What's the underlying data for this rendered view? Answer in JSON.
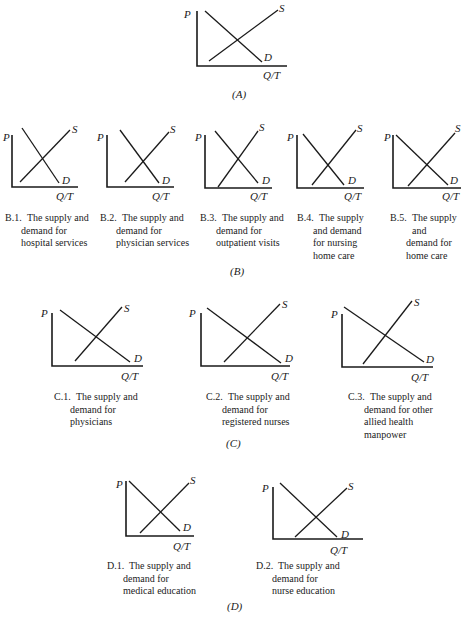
{
  "figure": {
    "axis_labels": {
      "price": "P",
      "quantity": "Q/T",
      "supply": "S",
      "demand": "D"
    },
    "sections": [
      {
        "id": "A",
        "label": "(A)",
        "x": 232,
        "y": 88
      },
      {
        "id": "B",
        "label": "(B)",
        "x": 230,
        "y": 265
      },
      {
        "id": "C",
        "label": "(C)",
        "x": 226,
        "y": 437
      },
      {
        "id": "D",
        "label": "(D)",
        "x": 227,
        "y": 600
      }
    ],
    "panels": [
      {
        "id": "A",
        "caption_num": "",
        "caption": [],
        "axis": {
          "x": 197,
          "top": 11,
          "bottom": 66,
          "right": 287
        },
        "demand": [
          205,
          11,
          262,
          62
        ],
        "supply": [
          209,
          61,
          278,
          10
        ],
        "p_pos": [
          184,
          8
        ],
        "s_pos": [
          279,
          2
        ],
        "d_pos": [
          264,
          51
        ],
        "qt_pos": [
          263,
          69
        ]
      },
      {
        "id": "B.1",
        "caption_num": "B.1.",
        "caption": [
          "The supply and",
          "demand for",
          "hospital services"
        ],
        "cap_pos": [
          5,
          212
        ],
        "axis": {
          "x": 12,
          "top": 135,
          "bottom": 187,
          "right": 78
        },
        "demand": [
          22,
          128,
          59,
          183
        ],
        "supply": [
          20,
          182,
          70,
          130
        ],
        "p_pos": [
          3,
          131
        ],
        "s_pos": [
          72,
          123
        ],
        "d_pos": [
          62,
          174
        ],
        "qt_pos": [
          56,
          190
        ]
      },
      {
        "id": "B.2",
        "caption_num": "B.2.",
        "caption": [
          "The supply and",
          "demand for",
          "physician services"
        ],
        "cap_pos": [
          100,
          212
        ],
        "axis": {
          "x": 107,
          "top": 135,
          "bottom": 187,
          "right": 174
        },
        "demand": [
          120,
          130,
          159,
          183
        ],
        "supply": [
          125,
          182,
          169,
          132
        ],
        "p_pos": [
          97,
          131
        ],
        "s_pos": [
          170,
          123
        ],
        "d_pos": [
          162,
          174
        ],
        "qt_pos": [
          152,
          190
        ]
      },
      {
        "id": "B.3",
        "caption_num": "B.3.",
        "caption": [
          "The supply and",
          "demand for",
          "outpatient visits"
        ],
        "cap_pos": [
          200,
          212
        ],
        "axis": {
          "x": 205,
          "top": 135,
          "bottom": 188,
          "right": 272
        },
        "demand": [
          215,
          131,
          258,
          183
        ],
        "supply": [
          218,
          187,
          258,
          131
        ],
        "p_pos": [
          195,
          131
        ],
        "s_pos": [
          259,
          121
        ],
        "d_pos": [
          262,
          174
        ],
        "qt_pos": [
          250,
          190
        ]
      },
      {
        "id": "B.4",
        "caption_num": "B.4.",
        "caption": [
          "The supply",
          "and demand",
          "for nursing",
          "home care"
        ],
        "cap_pos": [
          297,
          212
        ],
        "axis": {
          "x": 297,
          "top": 135,
          "bottom": 188,
          "right": 364
        },
        "demand": [
          303,
          134,
          344,
          185
        ],
        "supply": [
          312,
          185,
          356,
          130
        ],
        "p_pos": [
          287,
          131
        ],
        "s_pos": [
          357,
          122
        ],
        "d_pos": [
          348,
          174
        ],
        "qt_pos": [
          344,
          190
        ]
      },
      {
        "id": "B.5",
        "caption_num": "B.5.",
        "caption": [
          "The supply and",
          "demand for",
          "home care"
        ],
        "cap_pos": [
          390,
          212
        ],
        "axis": {
          "x": 393,
          "top": 135,
          "bottom": 188,
          "right": 461
        },
        "demand": [
          396,
          135,
          448,
          185
        ],
        "supply": [
          408,
          186,
          455,
          133
        ],
        "p_pos": [
          384,
          131
        ],
        "s_pos": [
          455,
          122
        ],
        "d_pos": [
          450,
          174
        ],
        "qt_pos": [
          442,
          190
        ]
      },
      {
        "id": "C.1",
        "caption_num": "C.1.",
        "caption": [
          "The supply and",
          "demand for",
          "physicians"
        ],
        "cap_pos": [
          54,
          391
        ],
        "axis": {
          "x": 52,
          "top": 313,
          "bottom": 366,
          "right": 143
        },
        "demand": [
          60,
          310,
          130,
          362
        ],
        "supply": [
          75,
          361,
          122,
          307
        ],
        "p_pos": [
          41,
          307
        ],
        "s_pos": [
          124,
          302
        ],
        "d_pos": [
          134,
          352
        ],
        "qt_pos": [
          121,
          370
        ]
      },
      {
        "id": "C.2",
        "caption_num": "C.2.",
        "caption": [
          "The supply and",
          "demand for",
          "registered nurses"
        ],
        "cap_pos": [
          206,
          391
        ],
        "axis": {
          "x": 201,
          "top": 313,
          "bottom": 366,
          "right": 290
        },
        "demand": [
          207,
          308,
          281,
          363
        ],
        "supply": [
          224,
          362,
          280,
          304
        ],
        "p_pos": [
          189,
          307
        ],
        "s_pos": [
          282,
          298
        ],
        "d_pos": [
          285,
          352
        ],
        "qt_pos": [
          271,
          370
        ]
      },
      {
        "id": "C.3",
        "caption_num": "C.3.",
        "caption": [
          "The supply and",
          "demand for other",
          "allied health",
          "manpower"
        ],
        "cap_pos": [
          348,
          391
        ],
        "axis": {
          "x": 342,
          "top": 314,
          "bottom": 367,
          "right": 433
        },
        "demand": [
          344,
          307,
          424,
          362
        ],
        "supply": [
          363,
          364,
          412,
          301
        ],
        "p_pos": [
          331,
          308
        ],
        "s_pos": [
          414,
          296
        ],
        "d_pos": [
          426,
          353
        ],
        "qt_pos": [
          411,
          371
        ]
      },
      {
        "id": "D.1",
        "caption_num": "D.1.",
        "caption": [
          "The supply and",
          "demand for",
          "medical education"
        ],
        "cap_pos": [
          107,
          560
        ],
        "axis": {
          "x": 126,
          "top": 481,
          "bottom": 536,
          "right": 194
        },
        "demand": [
          129,
          481,
          180,
          531
        ],
        "supply": [
          140,
          533,
          189,
          483
        ],
        "p_pos": [
          116,
          478
        ],
        "s_pos": [
          190,
          474
        ],
        "d_pos": [
          183,
          521
        ],
        "qt_pos": [
          173,
          540
        ]
      },
      {
        "id": "D.2",
        "caption_num": "D.2.",
        "caption": [
          "The supply and",
          "demand for",
          "nurse education"
        ],
        "cap_pos": [
          256,
          560
        ],
        "axis": {
          "x": 273,
          "top": 487,
          "bottom": 539,
          "right": 363
        },
        "demand": [
          280,
          483,
          337,
          537
        ],
        "supply": [
          295,
          537,
          347,
          488
        ],
        "p_pos": [
          262,
          482
        ],
        "s_pos": [
          348,
          480
        ],
        "d_pos": [
          341,
          528
        ],
        "qt_pos": [
          330,
          544
        ]
      }
    ]
  },
  "chart_data": {
    "type": "line",
    "xlabel": "Q/T",
    "ylabel": "P",
    "grid": false,
    "series_labels": [
      "S",
      "D"
    ],
    "panels": [
      {
        "id": "A",
        "caption": "",
        "demand_slope": "moderate downward",
        "supply_slope": "moderate upward"
      },
      {
        "id": "B.1",
        "caption": "The supply and demand for hospital services"
      },
      {
        "id": "B.2",
        "caption": "The supply and demand for physician services"
      },
      {
        "id": "B.3",
        "caption": "The supply and demand for outpatient visits"
      },
      {
        "id": "B.4",
        "caption": "The supply and demand for nursing home care"
      },
      {
        "id": "B.5",
        "caption": "The supply and demand for home care"
      },
      {
        "id": "C.1",
        "caption": "The supply and demand for physicians"
      },
      {
        "id": "C.2",
        "caption": "The supply and demand for registered nurses"
      },
      {
        "id": "C.3",
        "caption": "The supply and demand for other allied health manpower"
      },
      {
        "id": "D.1",
        "caption": "The supply and demand for medical education"
      },
      {
        "id": "D.2",
        "caption": "The supply and demand for nurse education"
      }
    ],
    "group_labels": [
      "(A)",
      "(B)",
      "(C)",
      "(D)"
    ]
  }
}
